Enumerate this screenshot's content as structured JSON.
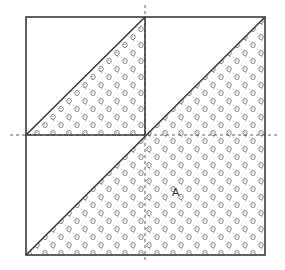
{
  "diagram": {
    "type": "quilt-block-pattern",
    "label_a": "A",
    "colors": {
      "line": "#3a3a3a",
      "dashed_line": "#4a4a4a",
      "motif": "#6a6a6a",
      "background": "#ffffff"
    },
    "outer_square": {
      "x": 26,
      "y": 17,
      "width": 239,
      "height": 238
    },
    "inner_square": {
      "x": 26,
      "y": 17,
      "width": 119,
      "height": 118
    },
    "guides": {
      "vertical_x": 145,
      "horizontal_y": 135
    },
    "shaded_regions": [
      {
        "name": "small-triangle",
        "points": "26,135 145,17 145,135"
      },
      {
        "name": "large-triangle",
        "points": "26,255 265,17 265,255"
      }
    ]
  }
}
